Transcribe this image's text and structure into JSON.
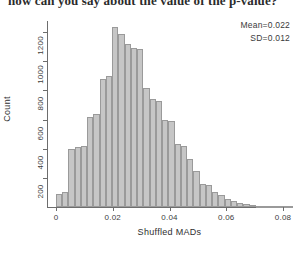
{
  "header": {
    "text": "how can you say about the value of the p-value?"
  },
  "annotations": {
    "mean": "Mean=0.022",
    "sd": "SD=0.012"
  },
  "chart_data": {
    "type": "bar",
    "title": "",
    "subtitle": "",
    "xlabel": "Shuffled MADs",
    "ylabel": "Count",
    "xlim": [
      0,
      0.0852
    ],
    "ylim": [
      0,
      1290
    ],
    "grid": false,
    "legend_position": "none",
    "bar_color": "#c6c6c6",
    "bar_edge_color": "#9a9a9a",
    "xticks": [
      0,
      0.02,
      0.04,
      0.06,
      0.08
    ],
    "xtick_labels": [
      "0",
      "0.02",
      "0.04",
      "0.06",
      "0.08"
    ],
    "yticks": [
      200,
      400,
      600,
      800,
      1000,
      1200
    ],
    "ytick_labels": [
      "200",
      "400",
      "600",
      "800",
      "1000",
      "1200"
    ],
    "bin_width": 0.0022,
    "x": [
      0.0011,
      0.0033,
      0.0055,
      0.0077,
      0.0099,
      0.0121,
      0.0143,
      0.0165,
      0.0187,
      0.0209,
      0.0231,
      0.0253,
      0.0275,
      0.0297,
      0.0319,
      0.0341,
      0.0363,
      0.0385,
      0.0407,
      0.0429,
      0.0451,
      0.0473,
      0.0495,
      0.0517,
      0.0539,
      0.0561,
      0.0583,
      0.0605,
      0.0627,
      0.0649,
      0.0671,
      0.0693,
      0.0715,
      0.0737,
      0.0759,
      0.0781,
      0.0803,
      0.0825
    ],
    "categories": [
      "0.0011",
      "0.0033",
      "0.0055",
      "0.0077",
      "0.0099",
      "0.0121",
      "0.0143",
      "0.0165",
      "0.0187",
      "0.0209",
      "0.0231",
      "0.0253",
      "0.0275",
      "0.0297",
      "0.0319",
      "0.0341",
      "0.0363",
      "0.0385",
      "0.0407",
      "0.0429",
      "0.0451",
      "0.0473",
      "0.0495",
      "0.0517",
      "0.0539",
      "0.0561",
      "0.0583",
      "0.0605",
      "0.0627",
      "0.0649",
      "0.0671",
      "0.0693",
      "0.0715",
      "0.0737",
      "0.0759",
      "0.0781",
      "0.0803",
      "0.0825"
    ],
    "values": [
      90,
      105,
      400,
      410,
      420,
      620,
      640,
      880,
      900,
      1235,
      1190,
      1120,
      1090,
      1085,
      820,
      740,
      730,
      600,
      590,
      430,
      420,
      330,
      245,
      160,
      150,
      100,
      80,
      55,
      40,
      25,
      18,
      12,
      8,
      6,
      4,
      3,
      2,
      1
    ],
    "stats": {
      "mean": 0.022,
      "sd": 0.012
    }
  }
}
